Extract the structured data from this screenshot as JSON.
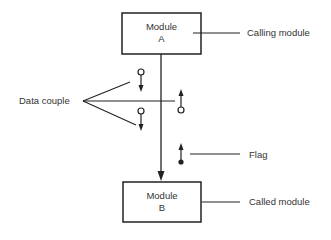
{
  "diagram": {
    "type": "structure-chart-legend",
    "modules": [
      {
        "id": "A",
        "line1": "Module",
        "line2": "A",
        "annotation": "Calling module"
      },
      {
        "id": "B",
        "line1": "Module",
        "line2": "B",
        "annotation": "Called module"
      }
    ],
    "labels": {
      "data_couple": "Data couple",
      "flag": "Flag"
    },
    "couples": [
      {
        "kind": "data",
        "direction": "down",
        "side": "left"
      },
      {
        "kind": "data",
        "direction": "down",
        "side": "left"
      },
      {
        "kind": "data",
        "direction": "up",
        "side": "right"
      },
      {
        "kind": "flag",
        "direction": "up",
        "side": "right"
      }
    ]
  }
}
